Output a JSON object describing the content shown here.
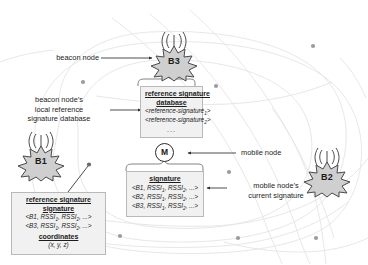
{
  "diagram": {
    "colors": {
      "contour": "#e2e2e2",
      "dot": "#9a9a9a",
      "node_fill": "#d2d2d2",
      "node_stroke": "#4a4a4a",
      "box_fill": "#f1f1f1",
      "box_stroke": "#b9b9b9",
      "text": "#1c1c1c",
      "connector": "#3a3a3a"
    },
    "beacons": [
      {
        "id": "beacon-b1",
        "label": "B1"
      },
      {
        "id": "beacon-b2",
        "label": "B2"
      },
      {
        "id": "beacon-b3",
        "label": "B3"
      }
    ],
    "mobile_node": {
      "label": "M"
    },
    "annotations": {
      "beacon_node": "beacon node",
      "beacon_db_line1": "beacon node’s",
      "beacon_db_line2": "local reference",
      "beacon_db_line3": "signature database",
      "mobile_node": "mobile node",
      "mobile_sig_line1": "mobile node’s",
      "mobile_sig_line2": "current signature"
    },
    "reference_signature_database": {
      "header_line1": "reference signature",
      "header_line2": "database",
      "entries": [
        {
          "text": "<reference-signature",
          "sub": "1",
          "tail": ">"
        },
        {
          "text": "<reference-signature",
          "sub": "2",
          "tail": ">"
        }
      ],
      "ellipsis": "..."
    },
    "mobile_signature": {
      "header": "signature",
      "rows": [
        {
          "prefix": "<B1, RSSI",
          "sub1": "1",
          "mid": ", RSSI",
          "sub2": "2",
          "tail": ", ...>"
        },
        {
          "prefix": "<B2, RSSI",
          "sub1": "1",
          "mid": ", RSSI",
          "sub2": "2",
          "tail": ", ...>"
        },
        {
          "prefix": "<B3, RSSI",
          "sub1": "1",
          "mid": ", RSSI",
          "sub2": "2",
          "tail": ", ...>"
        }
      ]
    },
    "reference_signature": {
      "header": "reference signature",
      "sig_header": "signature",
      "rows": [
        {
          "prefix": "<B1, RSSI",
          "sub1": "1",
          "mid": ", RSSI",
          "sub2": "2",
          "tail": ", ...>"
        },
        {
          "prefix": "<B3, RSSI",
          "sub1": "1",
          "mid": ", RSSI",
          "sub2": "2",
          "tail": ", ...>"
        }
      ],
      "coord_header": "coordinates",
      "coord_value": "(x, y, z)"
    }
  }
}
